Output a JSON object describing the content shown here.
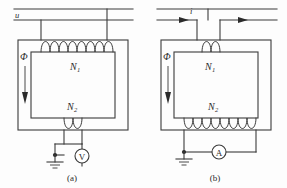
{
  "figure": {
    "background_color": "#fdfdfd",
    "line_color": "#3b3b3b",
    "panels": [
      {
        "id": "panel-a",
        "caption": "(a)",
        "source_label": "u",
        "source_label_kind": "voltage",
        "flux_label": "Φ",
        "flux_direction": "down",
        "primary_winding": {
          "label": "N",
          "subscript": "1",
          "turns": 8,
          "position": "top"
        },
        "secondary_winding": {
          "label": "N",
          "subscript": "2",
          "turns": 2,
          "position": "bottom"
        },
        "meter": {
          "symbol": "V",
          "name": "voltmeter",
          "orientation": "vertical"
        },
        "ground": {
          "name": "earth-ground",
          "present": true
        },
        "current_arrows": []
      },
      {
        "id": "panel-b",
        "caption": "(b)",
        "source_label": "i",
        "source_label_kind": "current",
        "flux_label": "Φ",
        "flux_direction": "down",
        "primary_winding": {
          "label": "N",
          "subscript": "1",
          "turns": 2,
          "position": "top"
        },
        "secondary_winding": {
          "label": "N",
          "subscript": "2",
          "turns": 8,
          "position": "bottom"
        },
        "meter": {
          "symbol": "A",
          "name": "ammeter",
          "orientation": "horizontal"
        },
        "ground": {
          "name": "earth-ground",
          "present": true
        },
        "current_arrows": [
          {
            "direction": "right",
            "position": "left-lead"
          },
          {
            "direction": "right",
            "position": "right-lead"
          }
        ]
      }
    ]
  }
}
